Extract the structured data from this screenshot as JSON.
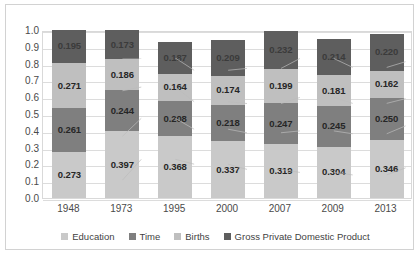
{
  "chart_data": {
    "type": "bar",
    "subtype": "stacked-bar-100",
    "title": "",
    "xlabel": "",
    "ylabel": "",
    "ylim": [
      0.0,
      1.0
    ],
    "grid": true,
    "legend_position": "bottom",
    "categories": [
      "1948",
      "1973",
      "1995",
      "2000",
      "2007",
      "2009",
      "2013"
    ],
    "ytick_labels": [
      "1.0",
      "0.9",
      "0.8",
      "0.7",
      "0.6",
      "0.5",
      "0.4",
      "0.3",
      "0.2",
      "0.1",
      "0.0"
    ],
    "ytick_values": [
      1.0,
      0.9,
      0.8,
      0.7,
      0.6,
      0.5,
      0.4,
      0.3,
      0.2,
      0.1,
      0.0
    ],
    "series": [
      {
        "name": "Education",
        "color": "#c9c9c9",
        "values": [
          0.273,
          0.397,
          0.368,
          0.337,
          0.319,
          0.304,
          0.346
        ],
        "labels": [
          "0.273",
          "0.397",
          "0.368",
          "0.337",
          "0.319",
          "0.304",
          "0.346"
        ]
      },
      {
        "name": "Time",
        "color": "#7f7f7f",
        "values": [
          0.261,
          0.244,
          0.208,
          0.218,
          0.247,
          0.245,
          0.25
        ],
        "labels": [
          "0.261",
          "0.244",
          "0.208",
          "0.218",
          "0.247",
          "0.245",
          "0.250"
        ]
      },
      {
        "name": "Births",
        "color": "#bfbfbf",
        "values": [
          0.271,
          0.186,
          0.164,
          0.174,
          0.199,
          0.181,
          0.162
        ],
        "labels": [
          "0.271",
          "0.186",
          "0.164",
          "0.174",
          "0.199",
          "0.181",
          "0.162"
        ]
      },
      {
        "name": "Gross Private Domestic Product",
        "color": "#5e5e5e",
        "values": [
          0.195,
          0.173,
          0.187,
          0.209,
          0.232,
          0.214,
          0.22
        ],
        "labels": [
          "0.195",
          "0.173",
          "0.187",
          "0.209",
          "0.232",
          "0.214",
          "0.220"
        ]
      }
    ],
    "totals": [
      1.0,
      1.0,
      0.927,
      0.938,
      1.0,
      0.944,
      0.978
    ]
  },
  "legend": {
    "items": [
      {
        "label": "Education",
        "color": "#c9c9c9"
      },
      {
        "label": "Time",
        "color": "#7f7f7f"
      },
      {
        "label": "Births",
        "color": "#bfbfbf"
      },
      {
        "label": "Gross Private Domestic Product",
        "color": "#5e5e5e"
      }
    ]
  },
  "yaxis": {
    "t0": "1.0",
    "t1": "0.9",
    "t2": "0.8",
    "t3": "0.7",
    "t4": "0.6",
    "t5": "0.5",
    "t6": "0.4",
    "t7": "0.3",
    "t8": "0.2",
    "t9": "0.1",
    "t10": "0.0"
  },
  "xaxis": {
    "c0": "1948",
    "c1": "1973",
    "c2": "1995",
    "c3": "2000",
    "c4": "2007",
    "c5": "2009",
    "c6": "2013"
  }
}
